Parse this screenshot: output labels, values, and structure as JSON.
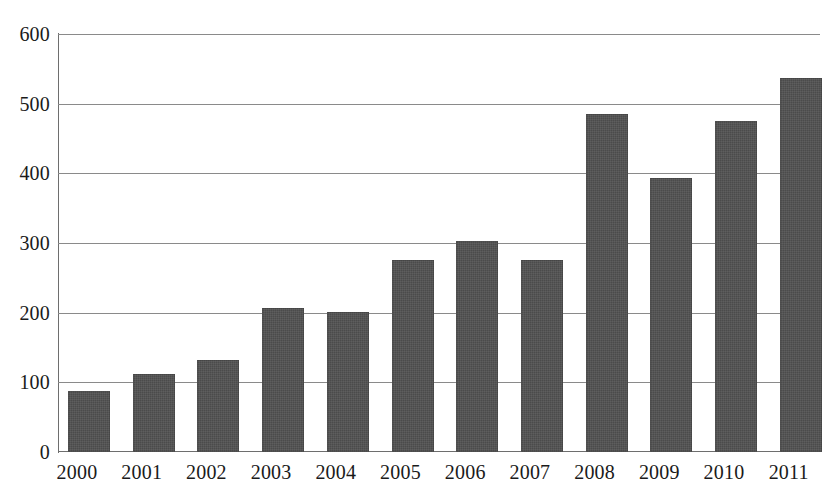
{
  "chart_data": {
    "type": "bar",
    "title": "",
    "subtitle": "",
    "xlabel": "",
    "ylabel": "",
    "categories": [
      "2000",
      "2001",
      "2002",
      "2003",
      "2004",
      "2005",
      "2006",
      "2007",
      "2008",
      "2009",
      "2010",
      "2011"
    ],
    "values": [
      88,
      112,
      132,
      207,
      201,
      275,
      303,
      275,
      485,
      393,
      475,
      537
    ],
    "ylim": [
      0,
      600
    ],
    "yticks": [
      0,
      100,
      200,
      300,
      400,
      500,
      600
    ],
    "ytick_labels": [
      "0",
      "100",
      "200",
      "300",
      "400",
      "500",
      "600"
    ],
    "grid": true,
    "legend": false,
    "legend_position": "none",
    "bar_color": "#4b4b4b",
    "gridline_color": "#8a8a8a",
    "axis_color": "#6e6e6e",
    "background_color": "#ffffff",
    "text_color": "#1a1a1a"
  }
}
